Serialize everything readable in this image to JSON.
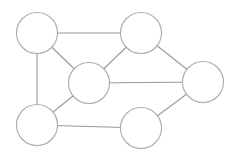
{
  "diagram": {
    "type": "undirected-graph",
    "background": "#ffffff",
    "edge_color": "#999999",
    "node_stroke_color": "#aaaaaa",
    "node_fill_color": "#ffffff",
    "node_radius": 20.5,
    "nodes": [
      {
        "id": "A",
        "cx": 37,
        "cy": 33
      },
      {
        "id": "B",
        "cx": 141,
        "cy": 33
      },
      {
        "id": "C",
        "cx": 89,
        "cy": 83
      },
      {
        "id": "E",
        "cx": 203,
        "cy": 82
      },
      {
        "id": "D",
        "cx": 37,
        "cy": 125
      },
      {
        "id": "F",
        "cx": 141,
        "cy": 128
      }
    ],
    "edges": [
      {
        "from": "A",
        "to": "B"
      },
      {
        "from": "A",
        "to": "C"
      },
      {
        "from": "A",
        "to": "D"
      },
      {
        "from": "B",
        "to": "C"
      },
      {
        "from": "B",
        "to": "E"
      },
      {
        "from": "C",
        "to": "E"
      },
      {
        "from": "C",
        "to": "D"
      },
      {
        "from": "D",
        "to": "F"
      },
      {
        "from": "F",
        "to": "E"
      }
    ]
  }
}
